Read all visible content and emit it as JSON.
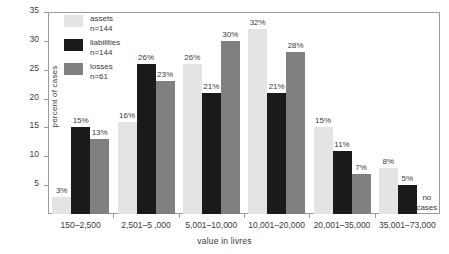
{
  "chart_data": {
    "type": "bar",
    "title": "",
    "xlabel": "value in livres",
    "ylabel": "percent of cases",
    "ylim": [
      0,
      35
    ],
    "yticks": [
      5,
      10,
      15,
      20,
      25,
      30,
      35
    ],
    "grid": false,
    "legend_position": "top-left-inside",
    "categories": [
      "150–2,500",
      "2,501–5 ,000",
      "5,001–10,000",
      "10,001–20,000",
      "20,001–35,000",
      "35,001–73,000"
    ],
    "series": [
      {
        "name": "assets",
        "n_label": "n=144",
        "color": "#e4e4e4",
        "values": [
          3,
          16,
          26,
          32,
          15,
          8
        ],
        "labels": [
          "3%",
          "16%",
          "26%",
          "32%",
          "15%",
          "8%"
        ]
      },
      {
        "name": "liabilities",
        "n_label": "n=144",
        "color": "#1a1a1a",
        "values": [
          15,
          26,
          21,
          21,
          11,
          5
        ],
        "labels": [
          "15%",
          "26%",
          "21%",
          "21%",
          "11%",
          "5%"
        ]
      },
      {
        "name": "losses",
        "n_label": "n=61",
        "color": "#808080",
        "values": [
          13,
          23,
          30,
          28,
          7,
          null
        ],
        "labels": [
          "13%",
          "23%",
          "30%",
          "28%",
          "7%",
          null
        ]
      }
    ],
    "annotations": [
      {
        "text_line1": "no",
        "text_line2": "cases",
        "category": "35,001–73,000",
        "series": "losses"
      }
    ]
  },
  "legend": {
    "items": [
      {
        "label": "assets",
        "n": "n=144",
        "color": "#e4e4e4"
      },
      {
        "label": "liabilities",
        "n": "n=144",
        "color": "#1a1a1a"
      },
      {
        "label": "losses",
        "n": "n=61",
        "color": "#808080"
      }
    ]
  },
  "axes": {
    "y_label": "percent of cases",
    "y_ticks": [
      "5",
      "10",
      "15",
      "20",
      "25",
      "30",
      "35"
    ],
    "x_label": "value in livres"
  }
}
